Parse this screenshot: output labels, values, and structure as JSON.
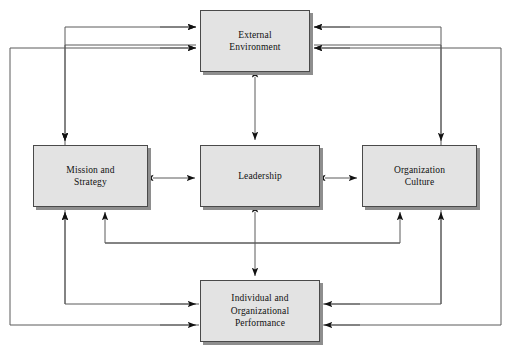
{
  "diagram": {
    "type": "block-flow-diagram",
    "canvas": {
      "width": 511,
      "height": 360
    },
    "style": {
      "box_fill": "#e3e3e3",
      "box_border": "#4a4a4a",
      "box_shadow": "#8e8e8e",
      "line_color": "#5a5a5a",
      "arrow_color": "#111111",
      "background": "#ffffff"
    },
    "nodes": [
      {
        "id": "external-environment",
        "label": "External\nEnvironment",
        "x": 200,
        "y": 10,
        "w": 110,
        "h": 62
      },
      {
        "id": "mission-and-strategy",
        "label": "Mission and\nStrategy",
        "x": 33,
        "y": 145,
        "w": 115,
        "h": 62
      },
      {
        "id": "leadership",
        "label": "Leadership",
        "x": 200,
        "y": 145,
        "w": 120,
        "h": 62
      },
      {
        "id": "organization-culture",
        "label": "Organization\nCulture",
        "x": 362,
        "y": 145,
        "w": 115,
        "h": 62
      },
      {
        "id": "individual-and-organizational-performance",
        "label": "Individual and\nOrganizational\nPerformance",
        "x": 200,
        "y": 280,
        "w": 120,
        "h": 62
      }
    ],
    "connections": [
      {
        "from": "individual-and-organizational-performance",
        "to": "external-environment",
        "kind": "outer-left-loop"
      },
      {
        "from": "organization-culture",
        "to": "external-environment",
        "kind": "outer-right-loop"
      },
      {
        "from": "mission-and-strategy",
        "to": "external-environment",
        "kind": "inner-left-loop"
      },
      {
        "from": "external-environment",
        "to": "mission-and-strategy",
        "kind": "inner-left-down"
      },
      {
        "from": "external-environment",
        "to": "organization-culture",
        "kind": "inner-right-down"
      },
      {
        "from": "external-environment",
        "to": "leadership",
        "kind": "bidirectional-vertical"
      },
      {
        "from": "mission-and-strategy",
        "to": "leadership",
        "kind": "bidirectional-horizontal"
      },
      {
        "from": "leadership",
        "to": "organization-culture",
        "kind": "bidirectional-horizontal"
      },
      {
        "from": "leadership",
        "to": "individual-and-organizational-performance",
        "kind": "bidirectional-vertical"
      },
      {
        "from": "individual-and-organizational-performance",
        "to": "mission-and-strategy",
        "kind": "feedback-up-left"
      },
      {
        "from": "organization-culture",
        "to": "mission-and-strategy",
        "kind": "cross-feedback-left"
      },
      {
        "from": "mission-and-strategy",
        "to": "organization-culture",
        "kind": "cross-feedback-right"
      },
      {
        "from": "individual-and-organizational-performance",
        "to": "organization-culture",
        "kind": "feedback-up-right"
      }
    ]
  }
}
